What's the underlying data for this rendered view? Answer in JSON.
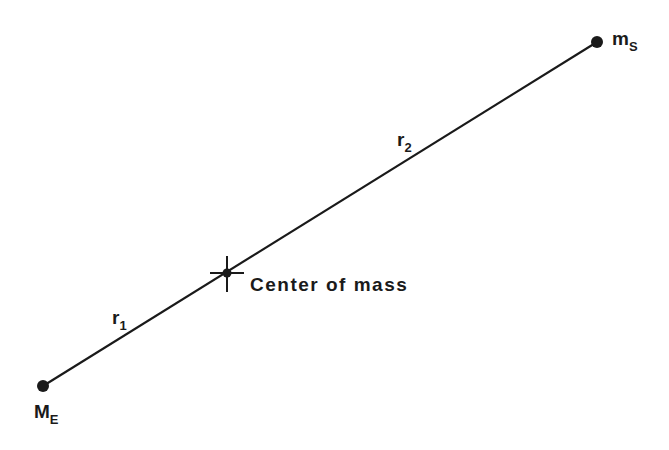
{
  "diagram": {
    "bodies": [
      {
        "id": "earth",
        "label": "M",
        "subscript": "E",
        "x": 43,
        "y": 386
      },
      {
        "id": "sun",
        "label": "m",
        "subscript": "S",
        "x": 597,
        "y": 42
      }
    ],
    "center_of_mass": {
      "label": "Center of mass",
      "x": 227,
      "y": 273
    },
    "distances": [
      {
        "id": "r1",
        "label": "r",
        "subscript": "1",
        "between": [
          "earth",
          "center_of_mass"
        ]
      },
      {
        "id": "r2",
        "label": "r",
        "subscript": "2",
        "between": [
          "center_of_mass",
          "sun"
        ]
      }
    ],
    "colors": {
      "ink": "#1a1a1a",
      "background": "#ffffff"
    }
  }
}
